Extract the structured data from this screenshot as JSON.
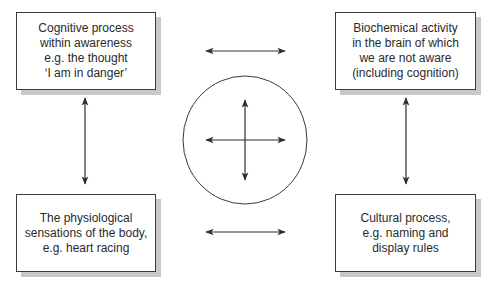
{
  "diagram": {
    "boxes": {
      "top_left": {
        "text": "Cognitive process\nwithin awareness\ne.g. the thought\n‘I am in danger’"
      },
      "top_right": {
        "text": "Biochemical activity\nin the brain of which\nwe are not aware\n(including cognition)"
      },
      "bottom_left": {
        "text": "The physiological\nsensations of the body,\ne.g. heart racing"
      },
      "bottom_right": {
        "text": "Cultural process,\ne.g. naming and\ndisplay rules"
      }
    },
    "center": {
      "shape": "circle",
      "contains": "four-way-arrow"
    },
    "connectors": [
      {
        "from": "top_left",
        "to": "top_right",
        "type": "bidirectional-arrow"
      },
      {
        "from": "bottom_left",
        "to": "bottom_right",
        "type": "bidirectional-arrow"
      },
      {
        "from": "top_left",
        "to": "bottom_left",
        "type": "bidirectional-arrow"
      },
      {
        "from": "top_right",
        "to": "bottom_right",
        "type": "bidirectional-arrow"
      }
    ],
    "colors": {
      "line": "#2e2e2e",
      "shadow": "#c8c8c8",
      "background": "#ffffff"
    }
  }
}
